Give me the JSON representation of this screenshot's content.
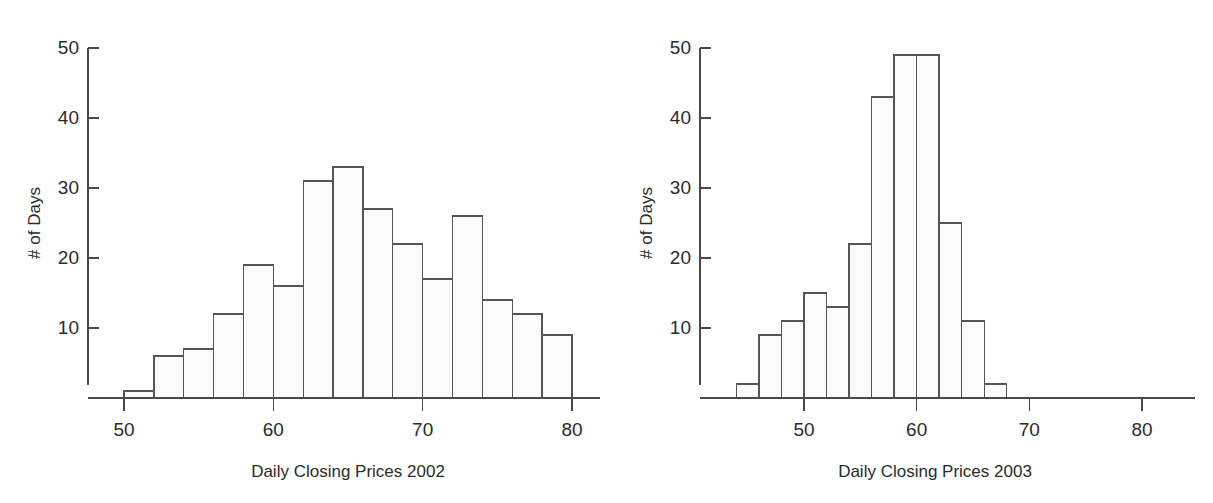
{
  "figure": {
    "background_color": "#ffffff",
    "line_color": "#4a4a4a",
    "bar_fill_color": "#fbfbfb",
    "bar_stroke_color": "#555555",
    "text_color": "#2b2b2b"
  },
  "panels": [
    {
      "name": "histogram-2002",
      "ylabel": "# of Days",
      "xlabel": "Daily Closing Prices 2002",
      "x_ticks": [
        "50",
        "60",
        "70",
        "80"
      ],
      "y_ticks": [
        "10",
        "20",
        "30",
        "40",
        "50"
      ]
    },
    {
      "name": "histogram-2003",
      "ylabel": "# of Days",
      "xlabel": "Daily Closing Prices 2003",
      "x_ticks": [
        "50",
        "60",
        "70",
        "80"
      ],
      "y_ticks": [
        "10",
        "20",
        "30",
        "40",
        "50"
      ]
    }
  ],
  "chart_data": [
    {
      "type": "bar",
      "title": "",
      "subtitle": "",
      "xlabel": "Daily Closing Prices 2002",
      "ylabel": "# of Days",
      "xlim": [
        48,
        82
      ],
      "ylim": [
        0,
        50
      ],
      "xticks": [
        50,
        60,
        70,
        80
      ],
      "yticks": [
        10,
        20,
        30,
        40,
        50
      ],
      "grid": false,
      "legend": false,
      "bin_width": 2,
      "bin_edges": [
        50,
        52,
        54,
        56,
        58,
        60,
        62,
        64,
        66,
        68,
        70,
        72,
        74,
        76,
        78,
        80
      ],
      "categories": [
        "50-52",
        "52-54",
        "54-56",
        "56-58",
        "58-60",
        "60-62",
        "62-64",
        "64-66",
        "66-68",
        "68-70",
        "70-72",
        "72-74",
        "74-76",
        "76-78",
        "78-80"
      ],
      "values": [
        1,
        6,
        7,
        12,
        19,
        16,
        31,
        33,
        27,
        22,
        17,
        26,
        14,
        12,
        9
      ]
    },
    {
      "type": "bar",
      "title": "",
      "subtitle": "",
      "xlabel": "Daily Closing Prices 2003",
      "ylabel": "# of Days",
      "xlim": [
        42,
        82
      ],
      "ylim": [
        0,
        50
      ],
      "xticks": [
        50,
        60,
        70,
        80
      ],
      "yticks": [
        10,
        20,
        30,
        40,
        50
      ],
      "grid": false,
      "legend": false,
      "bin_width": 2,
      "bin_edges": [
        44,
        46,
        48,
        50,
        52,
        54,
        56,
        58,
        60,
        62,
        64,
        66,
        68
      ],
      "categories": [
        "44-46",
        "46-48",
        "48-50",
        "50-52",
        "52-54",
        "54-56",
        "56-58",
        "58-60",
        "60-62",
        "62-64",
        "64-66",
        "66-68"
      ],
      "values": [
        2,
        9,
        11,
        15,
        13,
        22,
        43,
        49,
        49,
        25,
        11,
        2
      ]
    }
  ]
}
